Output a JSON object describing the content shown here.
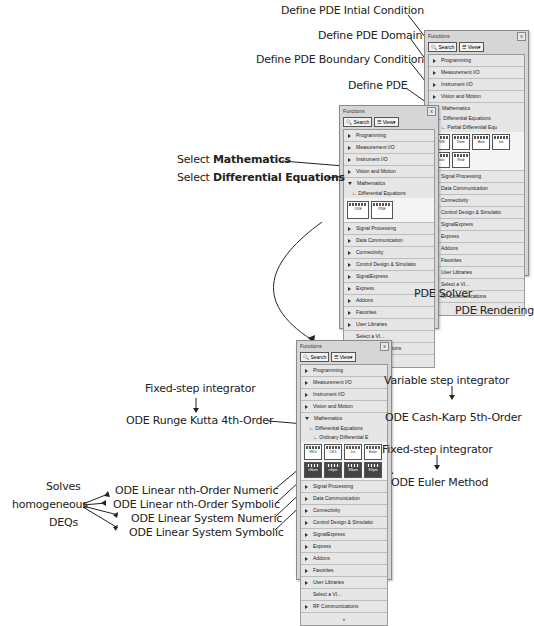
{
  "panel_common": {
    "title": "Functions",
    "close": "x",
    "search_label": "Search",
    "view_label": "View",
    "footer": "«"
  },
  "panel_pde": {
    "items_top": [
      "Programming",
      "Measurement I/O",
      "Instrument I/O",
      "Vision and Motion",
      "Mathematics"
    ],
    "sub1": "Differential Equations",
    "sub2": "Partial Differential Equ",
    "icons": [
      "PDE",
      "Dom",
      "Bnd",
      "Init",
      "Solv",
      "Rndr"
    ],
    "items_bottom": [
      "Signal Processing",
      "Data Communication",
      "Connectivity",
      "Control Design & Simulatio",
      "SignalExpress",
      "Express",
      "Addons",
      "Favorites",
      "User Libraries",
      "Select a VI...",
      "RF Communications"
    ]
  },
  "panel_math": {
    "items_top": [
      "Programming",
      "Measurement I/O",
      "Instrument I/O",
      "Vision and Motion",
      "Mathematics"
    ],
    "sub1": "Differential Equations",
    "icons": [
      "ODE",
      "PDE"
    ],
    "items_bottom": [
      "Signal Processing",
      "Data Communication",
      "Connectivity",
      "Control Design & Simulatio",
      "SignalExpress",
      "Express",
      "Addons",
      "Favorites",
      "User Libraries",
      "Select a VI...",
      "RF Communications"
    ]
  },
  "panel_ode": {
    "items_top": [
      "Programming",
      "Measurement I/O",
      "Instrument I/O",
      "Vision and Motion",
      "Mathematics"
    ],
    "sub1": "Differential Equations",
    "sub2": "Ordinary Differential E",
    "icons": [
      "RK4",
      "CK5",
      "Lin",
      "Euler",
      "nNum",
      "nSym",
      "SNum",
      "SSym"
    ],
    "items_bottom": [
      "Signal Processing",
      "Data Communication",
      "Connectivity",
      "Control Design & Simulatio",
      "SignalExpress",
      "Express",
      "Addons",
      "Favorites",
      "User Libraries",
      "Select a VI...",
      "RF Communications"
    ]
  },
  "annotations": {
    "pde_initial": "Define PDE Intial Condition",
    "pde_domain": "Define PDE Domain",
    "pde_boundary": "Define PDE Boundary Condition",
    "pde_define": "Define PDE",
    "select_prefix1": "Select ",
    "select_math": "Mathematics",
    "select_prefix2": "Select ",
    "select_diffeq": "Differential Equations",
    "pde_solver": "PDE Solver",
    "pde_rendering": "PDE Rendering",
    "fixed_step_1": "Fixed-step integrator",
    "rk4": "ODE Runge Kutta 4th-Order",
    "variable_step": "Variable step integrator",
    "cash_karp": "ODE Cash-Karp 5th-Order",
    "fixed_step_2": "Fixed-step integrator",
    "euler": "ODE Euler Method",
    "solves_1": "Solves",
    "solves_2": "homogeneous",
    "solves_3": "DEQs",
    "lin_n_num": "ODE Linear nth-Order Numeric",
    "lin_n_sym": "ODE Linear nth-Order Symbolic",
    "lin_sys_num": "ODE Linear System Numeric",
    "lin_sys_sym": "ODE Linear System Symbolic"
  }
}
